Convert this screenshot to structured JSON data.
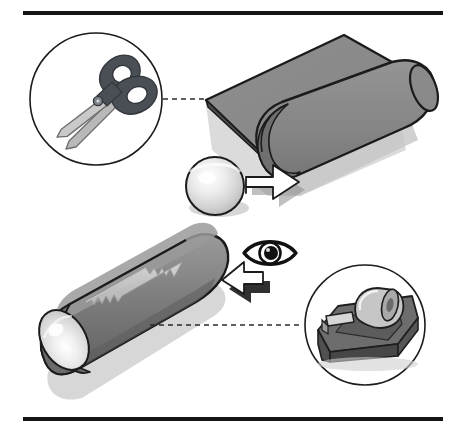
{
  "illustration": {
    "title": "Paper rolling craft instruction diagram",
    "type": "instructional-line-drawing",
    "canvas": {
      "width": 463,
      "height": 435,
      "background": "#ffffff"
    },
    "borders": [
      {
        "name": "top-rule",
        "x1": 23,
        "y1": 13,
        "x2": 443,
        "y2": 13,
        "thickness": 4,
        "color": "#141414"
      },
      {
        "name": "bottom-rule",
        "x1": 23,
        "y1": 419,
        "x2": 443,
        "y2": 419,
        "thickness": 4,
        "color": "#141414"
      }
    ],
    "panels": [
      {
        "name": "top-panel",
        "step": 1,
        "description": "Sheet of gray paper being rolled around a sphere, with scissors called out in a circle",
        "callout": {
          "name": "scissors-callout",
          "tool": "scissors",
          "circle": {
            "cx": 96,
            "cy": 99,
            "r": 66
          },
          "stroke": "#1a1a1a"
        },
        "connector": {
          "name": "scissors-connector",
          "x1": 163,
          "y1": 99,
          "x2": 208,
          "y2": 99,
          "style": "dashed"
        },
        "objects": [
          {
            "name": "rolled-paper-sheet",
            "material": "paper",
            "color": "#8a8a8a"
          },
          {
            "name": "sphere-ball",
            "material": "glass-ball",
            "color": "#d8d8d8"
          },
          {
            "name": "roll-direction-arrow",
            "color": "#ffffff",
            "direction": "up-right"
          }
        ]
      },
      {
        "name": "bottom-panel",
        "step": 2,
        "description": "Finished rolled tube sealed with tape, viewed through an eye, with tape dispenser called out in a circle",
        "callout": {
          "name": "tape-dispenser-callout",
          "tool": "tape-dispenser",
          "circle": {
            "cx": 365,
            "cy": 325,
            "r": 60
          },
          "stroke": "#1a1a1a"
        },
        "connector": {
          "name": "tape-connector",
          "x1": 150,
          "y1": 325,
          "x2": 303,
          "y2": 325,
          "style": "dashed"
        },
        "objects": [
          {
            "name": "rolled-tube",
            "material": "paper-tube",
            "color": "#6e6e6e"
          },
          {
            "name": "tape-strip",
            "material": "adhesive-tape",
            "color": "#cfcfcf"
          },
          {
            "name": "tube-end-ball",
            "material": "glass-ball",
            "color": "#dcdcdc"
          },
          {
            "name": "view-direction-arrow",
            "color": "#ffffff",
            "direction": "down-left"
          },
          {
            "name": "eye-symbol",
            "color": "#111111",
            "meaning": "look through here"
          }
        ]
      }
    ],
    "palette": {
      "ink": "#1a1a1a",
      "paper_gray": "#8a8a8a",
      "paper_gray_dark": "#6e6e6e",
      "paper_gray_light": "#9a9a9a",
      "tube_top": "#909090",
      "tape_light": "#cfcfcf",
      "ball_light": "#e6e6e6",
      "scissor_handle": "#4a4f55",
      "scissor_blade": "#b9b9b9",
      "shadow": "#c9c9c9",
      "white": "#ffffff"
    }
  }
}
